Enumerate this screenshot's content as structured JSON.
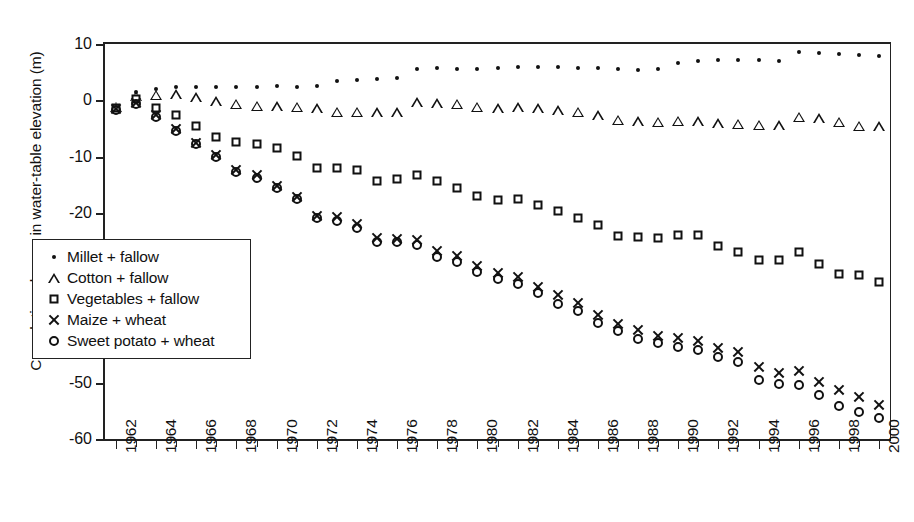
{
  "chart_data": {
    "type": "scatter",
    "title": "",
    "xlabel": "",
    "ylabel": "Cumulative change in water-table elevation (m)",
    "ylim": [
      -60,
      10
    ],
    "ytick_values": [
      10,
      0,
      -10,
      -20,
      -30,
      -40,
      -50,
      -60
    ],
    "ytick_labels": [
      "10",
      "0",
      "-10",
      "-20",
      "-30",
      "-40",
      "-50",
      "-60"
    ],
    "xlim": [
      1961.5,
      2000.5
    ],
    "x": [
      1962,
      1963,
      1964,
      1965,
      1966,
      1967,
      1968,
      1969,
      1970,
      1971,
      1972,
      1973,
      1974,
      1975,
      1976,
      1977,
      1978,
      1979,
      1980,
      1981,
      1982,
      1983,
      1984,
      1985,
      1986,
      1987,
      1988,
      1989,
      1990,
      1991,
      1992,
      1993,
      1994,
      1995,
      1996,
      1997,
      1998,
      1999,
      2000
    ],
    "xtick_labels": [
      "1962",
      "",
      "1964",
      "",
      "1966",
      "",
      "1968",
      "",
      "1970",
      "",
      "1972",
      "",
      "1974",
      "",
      "1976",
      "",
      "1978",
      "",
      "1980",
      "",
      "1982",
      "",
      "1984",
      "",
      "1986",
      "",
      "1988",
      "",
      "1990",
      "",
      "1992",
      "",
      "1994",
      "",
      "1996",
      "",
      "1998",
      "",
      "2000"
    ],
    "grid": false,
    "legend_position": "lower-left",
    "series": [
      {
        "name": "Millet + fallow",
        "marker": "dot",
        "values": [
          -1.2,
          1.5,
          2.0,
          2.3,
          2.4,
          2.3,
          2.4,
          2.4,
          2.5,
          2.4,
          2.6,
          3.4,
          3.6,
          3.8,
          4.0,
          5.6,
          5.7,
          5.6,
          5.6,
          5.8,
          5.9,
          5.9,
          5.9,
          5.8,
          5.7,
          5.5,
          5.4,
          5.5,
          6.6,
          7.0,
          7.1,
          7.2,
          7.1,
          7.0,
          8.5,
          8.4,
          8.2,
          8.0,
          7.8
        ]
      },
      {
        "name": "Cotton + fallow",
        "marker": "triangle",
        "values": [
          -1.1,
          0.8,
          1.0,
          1.1,
          0.6,
          -0.1,
          -0.6,
          -0.9,
          -1.0,
          -1.1,
          -1.4,
          -2.0,
          -2.0,
          -2.1,
          -2.1,
          -0.3,
          -0.5,
          -0.6,
          -1.1,
          -1.4,
          -1.2,
          -1.4,
          -1.7,
          -2.0,
          -2.6,
          -3.4,
          -3.7,
          -3.8,
          -3.6,
          -3.7,
          -4.0,
          -4.1,
          -4.3,
          -4.4,
          -2.9,
          -3.1,
          -3.8,
          -4.5,
          -4.6
        ]
      },
      {
        "name": "Vegetables + fallow",
        "marker": "square",
        "values": [
          -1.3,
          0.3,
          -1.3,
          -2.6,
          -4.6,
          -6.5,
          -7.3,
          -7.8,
          -8.4,
          -9.8,
          -12.0,
          -11.9,
          -12.4,
          -14.3,
          -13.9,
          -13.3,
          -14.3,
          -15.5,
          -16.9,
          -17.7,
          -17.4,
          -18.5,
          -19.6,
          -20.8,
          -22.0,
          -24.0,
          -24.2,
          -24.4,
          -23.8,
          -23.9,
          -25.8,
          -26.8,
          -28.2,
          -28.2,
          -26.8,
          -29.0,
          -30.8,
          -31.0,
          -32.2
        ]
      },
      {
        "name": "Maize + wheat",
        "marker": "x",
        "values": [
          -1.6,
          -0.4,
          -2.6,
          -5.1,
          -7.5,
          -9.6,
          -12.3,
          -13.2,
          -15.2,
          -17.1,
          -20.4,
          -20.7,
          -21.9,
          -24.3,
          -24.5,
          -24.7,
          -26.7,
          -27.6,
          -29.4,
          -30.6,
          -31.3,
          -33.0,
          -34.5,
          -35.9,
          -38.1,
          -39.6,
          -40.7,
          -41.7,
          -42.1,
          -42.6,
          -43.9,
          -44.5,
          -47.3,
          -48.3,
          -48.0,
          -49.9,
          -51.4,
          -52.6,
          -53.9
        ]
      },
      {
        "name": "Sweet potato + wheat",
        "marker": "circle",
        "values": [
          -1.7,
          -0.6,
          -2.9,
          -5.4,
          -7.8,
          -10.0,
          -12.6,
          -13.8,
          -15.5,
          -17.4,
          -20.9,
          -21.4,
          -22.6,
          -25.0,
          -25.1,
          -25.6,
          -27.8,
          -28.6,
          -30.4,
          -31.7,
          -32.5,
          -34.1,
          -36.0,
          -37.3,
          -39.4,
          -40.9,
          -42.2,
          -43.0,
          -43.7,
          -44.2,
          -45.5,
          -46.3,
          -49.6,
          -50.3,
          -50.4,
          -52.2,
          -54.2,
          -55.2,
          -56.3
        ]
      }
    ]
  }
}
